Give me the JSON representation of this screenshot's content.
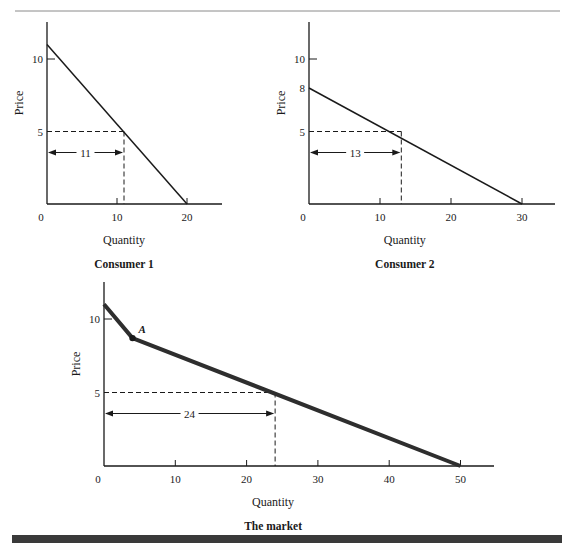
{
  "figure": {
    "top_rule_color": "#8a8a8a",
    "bottom_bar_color": "#3a3a3a",
    "ink_color": "#1a1a1a"
  },
  "chart_data": [
    {
      "type": "line",
      "title": "Consumer 1",
      "xlabel": "Quantity",
      "ylabel": "Price",
      "xlim": [
        0,
        25
      ],
      "ylim": [
        0,
        12.5
      ],
      "x_ticks": [
        0,
        10,
        20
      ],
      "x_tick_labels": [
        "0",
        "10",
        "20"
      ],
      "y_ticks": [
        5,
        10
      ],
      "y_tick_labels": [
        "5",
        "10"
      ],
      "grid": false,
      "legend": "none",
      "series": [
        {
          "name": "Demand curve",
          "points": [
            [
              0,
              11
            ],
            [
              20,
              0
            ]
          ],
          "line_width": 1.5
        }
      ],
      "reference": {
        "price": 5,
        "quantity": 11,
        "label": "11"
      },
      "layout": {
        "x0": 47,
        "y0": 204,
        "px_per_x": 7.0,
        "px_per_y": 14.5,
        "x_end": 222,
        "y_top": 22
      }
    },
    {
      "type": "line",
      "title": "Consumer 2",
      "xlabel": "Quantity",
      "ylabel": "Price",
      "xlim": [
        0,
        35
      ],
      "ylim": [
        0,
        12.5
      ],
      "x_ticks": [
        0,
        10,
        20,
        30
      ],
      "x_tick_labels": [
        "0",
        "10",
        "20",
        "30"
      ],
      "y_ticks": [
        5,
        8,
        10
      ],
      "y_tick_labels": [
        "5",
        "8",
        "10"
      ],
      "grid": false,
      "legend": "none",
      "series": [
        {
          "name": "Demand curve",
          "points": [
            [
              0,
              8
            ],
            [
              30,
              0
            ]
          ],
          "line_width": 1.5
        }
      ],
      "reference": {
        "price": 5,
        "quantity": 13,
        "label": "13"
      },
      "layout": {
        "x0": 309,
        "y0": 204,
        "px_per_x": 7.1,
        "px_per_y": 14.5,
        "x_end": 555,
        "y_top": 22
      }
    },
    {
      "type": "line",
      "title": "The market",
      "xlabel": "Quantity",
      "ylabel": "Price",
      "xlim": [
        0,
        55
      ],
      "ylim": [
        0,
        12
      ],
      "x_ticks": [
        0,
        10,
        20,
        30,
        40,
        50
      ],
      "x_tick_labels": [
        "0",
        "10",
        "20",
        "30",
        "40",
        "50"
      ],
      "y_ticks": [
        5,
        10
      ],
      "y_tick_labels": [
        "5",
        "10"
      ],
      "grid": false,
      "legend": "none",
      "series": [
        {
          "name": "Market demand curve",
          "points": [
            [
              0,
              11
            ],
            [
              4,
              8.7
            ],
            [
              50,
              0
            ]
          ],
          "line_width": 4
        }
      ],
      "annotations": [
        {
          "label": "A",
          "x": 4,
          "y": 8.7,
          "marker": "dot"
        }
      ],
      "reference": {
        "price": 5,
        "quantity": 24,
        "label": "24"
      },
      "layout": {
        "x0": 104,
        "y0": 466,
        "px_per_x": 7.13,
        "px_per_y": 14.7,
        "x_end": 494,
        "y_top": 282
      }
    }
  ]
}
